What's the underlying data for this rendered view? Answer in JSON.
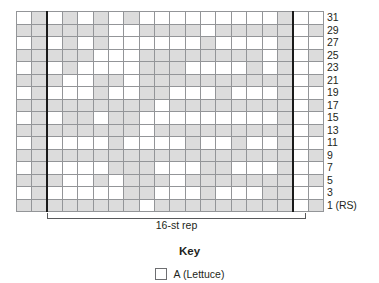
{
  "figure": {
    "type": "knitting-colorwork-chart",
    "repeat_bracket_label": "16-st rep",
    "repeat_stitches": 16,
    "row_label_suffix": "(RS)"
  },
  "key": {
    "title": "Key",
    "entries": [
      {
        "symbol": "empty-square",
        "label": "A (Lettuce)",
        "color": "#ffffff"
      }
    ]
  },
  "colors": {
    "cell_a": "#ffffff",
    "cell_b": "#dcdcdc",
    "grid_line": "#939598",
    "grid_border": "#6d6e71",
    "repeat_line": "#1a1a1a",
    "text": "#231f20"
  },
  "chart_data": {
    "type": "heatmap",
    "title": "",
    "xlabel": "",
    "ylabel": "",
    "grid": true,
    "legend_position": "bottom",
    "columns": 20,
    "rows": 16,
    "repeat_start_column": 3,
    "repeat_end_column": 18,
    "x": [
      1,
      2,
      3,
      4,
      5,
      6,
      7,
      8,
      9,
      10,
      11,
      12,
      13,
      14,
      15,
      16,
      17,
      18,
      19,
      20
    ],
    "row_labels": [
      "31",
      "29",
      "27",
      "25",
      "23",
      "21",
      "19",
      "17",
      "15",
      "13",
      "11",
      "9",
      "7",
      "5",
      "3",
      "1 (RS)"
    ],
    "legend_entries": [
      "A (Lettuce)"
    ],
    "value_colors": {
      "A": "#ffffff",
      "B": "#dcdcdc"
    },
    "cells": [
      [
        "A",
        "B",
        "A",
        "B",
        "A",
        "B",
        "A",
        "B",
        "A",
        "A",
        "A",
        "A",
        "A",
        "A",
        "A",
        "A",
        "A",
        "B",
        "A",
        "A"
      ],
      [
        "B",
        "B",
        "B",
        "B",
        "B",
        "B",
        "A",
        "A",
        "B",
        "B",
        "B",
        "B",
        "A",
        "B",
        "B",
        "B",
        "B",
        "B",
        "A",
        "B"
      ],
      [
        "A",
        "B",
        "A",
        "B",
        "A",
        "B",
        "A",
        "A",
        "A",
        "A",
        "A",
        "A",
        "B",
        "A",
        "A",
        "A",
        "A",
        "B",
        "A",
        "A"
      ],
      [
        "B",
        "B",
        "B",
        "B",
        "B",
        "A",
        "A",
        "A",
        "B",
        "B",
        "B",
        "B",
        "B",
        "B",
        "B",
        "B",
        "A",
        "B",
        "A",
        "B"
      ],
      [
        "A",
        "B",
        "A",
        "B",
        "A",
        "A",
        "A",
        "A",
        "B",
        "B",
        "B",
        "A",
        "A",
        "A",
        "A",
        "B",
        "A",
        "B",
        "A",
        "A"
      ],
      [
        "B",
        "B",
        "B",
        "A",
        "A",
        "B",
        "B",
        "A",
        "B",
        "B",
        "B",
        "B",
        "B",
        "B",
        "B",
        "B",
        "B",
        "B",
        "A",
        "B"
      ],
      [
        "A",
        "B",
        "A",
        "A",
        "A",
        "B",
        "A",
        "A",
        "B",
        "B",
        "A",
        "A",
        "A",
        "B",
        "A",
        "A",
        "A",
        "B",
        "A",
        "A"
      ],
      [
        "B",
        "B",
        "B",
        "B",
        "B",
        "B",
        "B",
        "B",
        "B",
        "A",
        "B",
        "B",
        "B",
        "B",
        "B",
        "B",
        "B",
        "B",
        "A",
        "B"
      ],
      [
        "A",
        "B",
        "A",
        "B",
        "B",
        "A",
        "B",
        "B",
        "A",
        "A",
        "A",
        "A",
        "A",
        "A",
        "A",
        "A",
        "A",
        "B",
        "A",
        "A"
      ],
      [
        "B",
        "B",
        "B",
        "B",
        "B",
        "B",
        "B",
        "B",
        "A",
        "B",
        "B",
        "B",
        "B",
        "B",
        "B",
        "B",
        "B",
        "B",
        "A",
        "B"
      ],
      [
        "A",
        "B",
        "A",
        "A",
        "A",
        "A",
        "B",
        "A",
        "A",
        "A",
        "A",
        "B",
        "A",
        "A",
        "B",
        "A",
        "A",
        "B",
        "A",
        "A"
      ],
      [
        "B",
        "B",
        "B",
        "B",
        "B",
        "B",
        "B",
        "B",
        "B",
        "B",
        "B",
        "B",
        "B",
        "B",
        "B",
        "B",
        "B",
        "B",
        "A",
        "B"
      ],
      [
        "A",
        "B",
        "A",
        "A",
        "A",
        "A",
        "B",
        "B",
        "B",
        "A",
        "A",
        "A",
        "B",
        "B",
        "A",
        "A",
        "A",
        "B",
        "A",
        "A"
      ],
      [
        "B",
        "B",
        "B",
        "A",
        "A",
        "B",
        "A",
        "B",
        "B",
        "B",
        "A",
        "B",
        "B",
        "B",
        "B",
        "B",
        "B",
        "B",
        "A",
        "B"
      ],
      [
        "A",
        "B",
        "A",
        "A",
        "A",
        "A",
        "A",
        "B",
        "B",
        "A",
        "A",
        "A",
        "B",
        "A",
        "A",
        "A",
        "B",
        "B",
        "A",
        "A"
      ],
      [
        "B",
        "B",
        "B",
        "B",
        "B",
        "B",
        "B",
        "B",
        "A",
        "B",
        "B",
        "B",
        "B",
        "B",
        "B",
        "B",
        "B",
        "B",
        "A",
        "B"
      ]
    ]
  }
}
